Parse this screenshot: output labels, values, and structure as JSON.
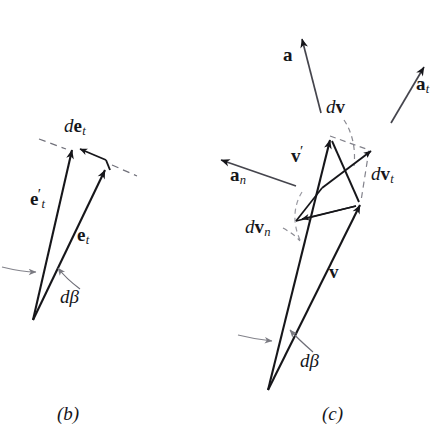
{
  "figure": {
    "background_color": "#ffffff",
    "ink_color": "#16161a",
    "construction_color": "#8a8a90",
    "width": 445,
    "height": 442
  },
  "panels": [
    {
      "id": "b",
      "caption": "(b)",
      "caption_x": 58,
      "caption_y": 410,
      "labels": [
        {
          "name": "label-d-e-t",
          "text": "de_t",
          "x": 64,
          "y": 124
        },
        {
          "name": "label-e-t-prime",
          "text": "e'_t",
          "x": 32,
          "y": 192
        },
        {
          "name": "label-e-t",
          "text": "e_t",
          "x": 78,
          "y": 231
        },
        {
          "name": "label-d-beta-b",
          "text": "dβ",
          "x": 61,
          "y": 292
        }
      ]
    },
    {
      "id": "c",
      "caption": "(c)",
      "caption_x": 323,
      "caption_y": 410,
      "labels": [
        {
          "name": "label-a",
          "text": "a",
          "x": 285,
          "y": 52
        },
        {
          "name": "label-a-t",
          "text": "a_t",
          "x": 418,
          "y": 80
        },
        {
          "name": "label-d-v",
          "text": "dv",
          "x": 328,
          "y": 104
        },
        {
          "name": "label-v-prime",
          "text": "v'",
          "x": 293,
          "y": 150
        },
        {
          "name": "label-d-v-t",
          "text": "dv_t",
          "x": 373,
          "y": 171
        },
        {
          "name": "label-a-n",
          "text": "a_n",
          "x": 232,
          "y": 172
        },
        {
          "name": "label-d-v-n",
          "text": "dv_n",
          "x": 247,
          "y": 224
        },
        {
          "name": "label-v",
          "text": "v",
          "x": 330,
          "y": 268
        },
        {
          "name": "label-d-beta-c",
          "text": "dβ",
          "x": 301,
          "y": 356
        }
      ]
    }
  ],
  "geometry": {
    "panel_b": {
      "apex": [
        33,
        320
      ],
      "e_t_prime_tip": [
        72,
        147
      ],
      "e_t_tip": [
        105,
        167
      ],
      "tangent_dash_left": [
        [
          41,
          140
        ],
        [
          92,
          158
        ]
      ],
      "tangent_dash_right": [
        [
          88,
          160
        ],
        [
          133,
          178
        ]
      ],
      "d_e_t_arrow": [
        [
          103,
          160
        ],
        [
          78,
          150
        ]
      ],
      "angle_marker_arrow": [
        [
          2,
          268
        ],
        [
          37,
          272
        ]
      ],
      "d_beta_leader": [
        [
          78,
          288
        ],
        [
          58,
          268
        ]
      ]
    },
    "panel_c": {
      "apex": [
        268,
        390
      ],
      "v_prime_tip": [
        330,
        136
      ],
      "v_tip": [
        360,
        201
      ],
      "dvn_base": [
        295,
        222
      ],
      "dvn_tip": [
        355,
        205
      ],
      "parallelogram": [
        [
          330,
          136
        ],
        [
          368,
          150
        ],
        [
          360,
          201
        ],
        [
          322,
          187
        ]
      ],
      "a_vector": [
        [
          320,
          112
        ],
        [
          302,
          38
        ]
      ],
      "a_t_vector": [
        [
          392,
          122
        ],
        [
          424,
          67
        ]
      ],
      "a_n_vector": [
        [
          295,
          185
        ],
        [
          222,
          160
        ]
      ],
      "dv_leader": [
        [
          341,
          118
        ],
        [
          353,
          165
        ]
      ],
      "dvn_leader": [
        [
          283,
          228
        ],
        [
          300,
          240
        ]
      ],
      "angle_marker_arrow": [
        [
          240,
          336
        ],
        [
          274,
          341
        ]
      ],
      "d_beta_leader": [
        [
          312,
          350
        ],
        [
          290,
          330
        ]
      ]
    }
  }
}
